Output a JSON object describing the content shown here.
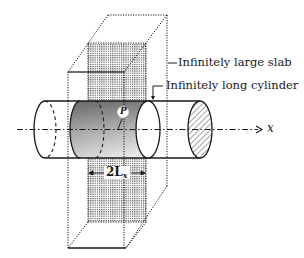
{
  "figure": {
    "labels": {
      "slab": "Infinitely large slab",
      "cylinder": "Infinitely long cylinder",
      "axis": "x",
      "point": "P",
      "dimension_main": "2L",
      "dimension_sub": "x"
    },
    "colors": {
      "line": "#1a1a1a",
      "dot_fill": "#6e6e6e",
      "cylinder_shade_dark": "#8a8a8a",
      "cylinder_shade_light": "#f2f2f2",
      "background": "#ffffff"
    }
  }
}
